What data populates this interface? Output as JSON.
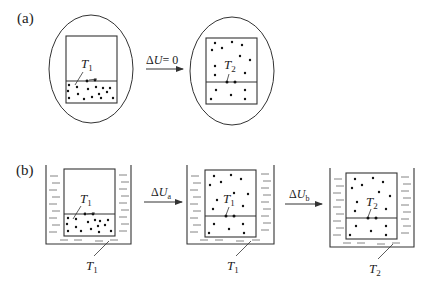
{
  "panels": {
    "a": {
      "label": "(a)",
      "before": {
        "temp_label": "T",
        "temp_sub": "1"
      },
      "process": {
        "label_prefix": "Δ",
        "label_var": "U",
        "label_suffix": "= 0"
      },
      "after": {
        "temp_label": "T",
        "temp_sub": "2"
      }
    },
    "b": {
      "label": "(b)",
      "stage1": {
        "temp_label": "T",
        "temp_sub": "1",
        "bath_label": "T",
        "bath_sub": "1"
      },
      "process_a": {
        "label_prefix": "Δ",
        "label_var": "U",
        "label_sub": "a"
      },
      "stage2": {
        "temp_label": "T",
        "temp_sub": "1",
        "bath_label": "T",
        "bath_sub": "1"
      },
      "process_b": {
        "label_prefix": "Δ",
        "label_var": "U",
        "label_sub": "b"
      },
      "stage3": {
        "temp_label": "T",
        "temp_sub": "2",
        "bath_label": "T",
        "bath_sub": "2"
      }
    }
  },
  "colors": {
    "stroke": "#333333",
    "background": "#ffffff",
    "dot": "#111111"
  }
}
